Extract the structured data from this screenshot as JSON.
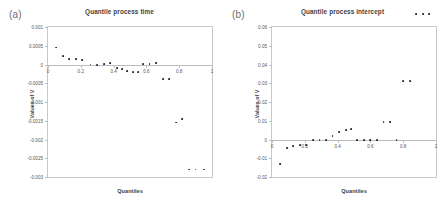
{
  "figure": {
    "background": "#ffffff",
    "marker_color": "#2b2b2b",
    "axis_color": "#c9c9c9"
  },
  "panels": [
    {
      "panel_label": "(a)",
      "title": "Quantile process time",
      "xlabel": "Quantiles",
      "ylabel": "Values of V"
    },
    {
      "panel_label": "(b)",
      "title": "Quantile process intercept",
      "xlabel": "Quantiles",
      "ylabel": "Values of V"
    }
  ],
  "chart_data": [
    {
      "type": "scatter",
      "title": "Quantile process time",
      "panel_label": "(a)",
      "xlabel": "Quantiles",
      "ylabel": "Values of V",
      "xlim": [
        0,
        1
      ],
      "ylim": [
        -0.003,
        0.001
      ],
      "xticks": [
        0,
        0.2,
        0.4,
        0.6,
        0.8,
        1
      ],
      "xticklabels": [
        "0",
        "0.2",
        "0.4",
        "0.6",
        "0.8",
        "1"
      ],
      "yticks": [
        0.001,
        0.0005,
        0,
        -0.0005,
        -0.001,
        -0.0015,
        -0.002,
        -0.0025,
        -0.003
      ],
      "yticklabels": [
        "0.001",
        "0.0005",
        "0",
        "-0.0005",
        "-0.001",
        "-0.0015",
        "-0.002",
        "-0.0025",
        "-0.003"
      ],
      "grid": false,
      "legend": null,
      "x": [
        0.05,
        0.09,
        0.13,
        0.17,
        0.21,
        0.26,
        0.3,
        0.34,
        0.38,
        0.42,
        0.45,
        0.48,
        0.52,
        0.55,
        0.58,
        0.62,
        0.66,
        0.7,
        0.74,
        0.78,
        0.82,
        0.86,
        0.9,
        0.95
      ],
      "y": [
        0.00045,
        0.00022,
        0.00015,
        0.00014,
        0.00012,
        0.0,
        -1e-05,
        2e-05,
        3e-05,
        -9e-05,
        -0.00013,
        -0.00018,
        -0.00021,
        -0.00021,
        2e-05,
        2e-05,
        3e-05,
        -0.00038,
        -0.00038,
        -0.00155,
        -0.00145,
        -0.0028,
        -0.0028,
        -0.0028
      ]
    },
    {
      "type": "scatter",
      "title": "Quantile process intercept",
      "panel_label": "(b)",
      "xlabel": "Quantiles",
      "ylabel": "Values of V",
      "xlim": [
        0,
        1
      ],
      "ylim": [
        -0.02,
        0.06
      ],
      "xticks": [
        0,
        0.2,
        0.4,
        0.6,
        0.8,
        1
      ],
      "xticklabels": [
        "0",
        "0.2",
        "0.4",
        "0.6",
        "0.8",
        "1"
      ],
      "yticks": [
        0.06,
        0.05,
        0.04,
        0.03,
        0.02,
        0.01,
        0,
        -0.01,
        -0.02
      ],
      "yticklabels": [
        "0.06",
        "0.05",
        "0.04",
        "0.03",
        "0.02",
        "0.01",
        "0",
        "-0.01",
        "-0.02"
      ],
      "grid": false,
      "legend": null,
      "x": [
        0.05,
        0.09,
        0.13,
        0.17,
        0.21,
        0.25,
        0.29,
        0.33,
        0.37,
        0.41,
        0.45,
        0.48,
        0.52,
        0.56,
        0.6,
        0.64,
        0.68,
        0.72,
        0.76,
        0.8,
        0.84,
        0.88,
        0.92,
        0.96
      ],
      "yvals": [
        -0.013,
        -0.0045,
        -0.0035,
        -0.003,
        -0.0028,
        -0.0002,
        -0.0002,
        -0.0002,
        0.002,
        0.004,
        0.0052,
        0.0056,
        -0.0002,
        -0.0002,
        -0.0002,
        -0.0002,
        0.0093,
        0.0093,
        -0.0002,
        0.031,
        0.031,
        0.067,
        0.067,
        0.067
      ]
    }
  ]
}
